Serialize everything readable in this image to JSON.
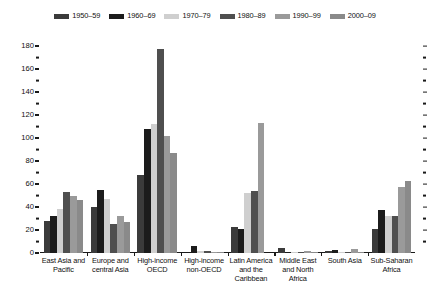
{
  "chart_data": {
    "type": "bar",
    "title": "",
    "subtitle": "",
    "xlabel": "",
    "ylabel": "",
    "ylim": [
      0,
      180
    ],
    "y_major_step": 20,
    "y_minor_step": 10,
    "grid": false,
    "legend_position": "top-center",
    "y_ticks_major": [
      "0",
      "20",
      "40",
      "60",
      "80",
      "100",
      "120",
      "140",
      "160",
      "180"
    ],
    "y_ticks_minor": [
      10,
      30,
      50,
      70,
      90,
      110,
      130,
      150,
      170
    ],
    "categories": [
      "East Asia and Pacific",
      "Europe and central Asia",
      "High-income OECD",
      "High-income non-OECD",
      "Latin America and the Caribbean",
      "Middle East and North Africa",
      "South Asia",
      "Sub-Saharan Africa"
    ],
    "category_lines": [
      [
        "East Asia and",
        "Pacific"
      ],
      [
        "Europe and",
        "central Asia"
      ],
      [
        "High-income",
        "OECD"
      ],
      [
        "High-income",
        "non-OECD"
      ],
      [
        "Latin America",
        "and the",
        "Caribbean"
      ],
      [
        "Middle East",
        "and North",
        "Africa"
      ],
      [
        "South Asia"
      ],
      [
        "Sub-Saharan",
        "Africa"
      ]
    ],
    "series": [
      {
        "name": "1950–59",
        "color": "#3b3b3b",
        "values": [
          28,
          40,
          68,
          0,
          23,
          4,
          1.5,
          21
        ]
      },
      {
        "name": "1960–69",
        "color": "#1c1c1c",
        "values": [
          32,
          55,
          108,
          6,
          21,
          1,
          3,
          37
        ]
      },
      {
        "name": "1970–79",
        "color": "#cfcfcf",
        "values": [
          38,
          47,
          112,
          2,
          52,
          0.5,
          0.5,
          32
        ]
      },
      {
        "name": "1980–89",
        "color": "#4f4f4f",
        "values": [
          53,
          25,
          177,
          1.5,
          54,
          0.5,
          0.5,
          32
        ]
      },
      {
        "name": "1990–99",
        "color": "#9a9a9a",
        "values": [
          50,
          32,
          102,
          1,
          113,
          2,
          3.5,
          57
        ]
      },
      {
        "name": "2000–09",
        "color": "#8a8a8a",
        "values": [
          46,
          27,
          87,
          0.5,
          0,
          1,
          0.5,
          63
        ]
      }
    ]
  },
  "legend": {
    "items": [
      {
        "label": "1950–59",
        "color": "#3b3b3b"
      },
      {
        "label": "1960–69",
        "color": "#1c1c1c"
      },
      {
        "label": "1970–79",
        "color": "#cfcfcf"
      },
      {
        "label": "1980–89",
        "color": "#4f4f4f"
      },
      {
        "label": "1990–99",
        "color": "#9a9a9a"
      },
      {
        "label": "2000–09",
        "color": "#8a8a8a"
      }
    ]
  }
}
